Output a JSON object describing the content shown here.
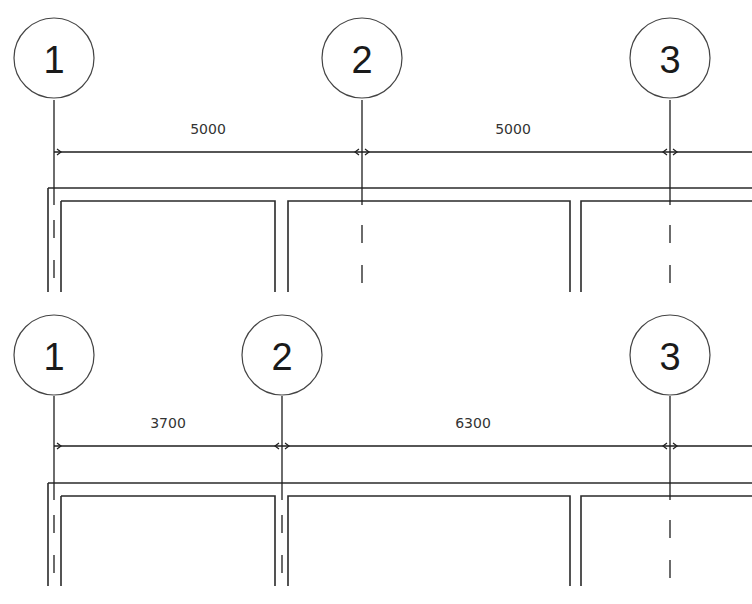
{
  "colors": {
    "line": "#1e1e1e",
    "text": "#1a1a1a",
    "background": "#ffffff"
  },
  "panels": [
    {
      "name": "panel-top-equal-spacing",
      "offset_y": 0,
      "grids": [
        {
          "label": "1",
          "x": 54
        },
        {
          "label": "2",
          "x": 362
        },
        {
          "label": "3",
          "x": 670
        }
      ],
      "dimensions": [
        {
          "value": "5000",
          "text_x": 208
        },
        {
          "value": "5000",
          "text_x": 513
        }
      ],
      "wall_openings": [
        {
          "left": 275,
          "right": 288
        },
        {
          "left": 570,
          "right": 583
        }
      ]
    },
    {
      "name": "panel-bottom-adjusted-spacing",
      "offset_y": 296,
      "grids": [
        {
          "label": "1",
          "x": 54
        },
        {
          "label": "2",
          "x": 282
        },
        {
          "label": "3",
          "x": 670
        }
      ],
      "dimensions": [
        {
          "value": "3700",
          "text_x": 168
        },
        {
          "value": "6300",
          "text_x": 473
        }
      ],
      "wall_openings": [
        {
          "left": 275,
          "right": 288
        },
        {
          "left": 570,
          "right": 583
        }
      ]
    }
  ]
}
